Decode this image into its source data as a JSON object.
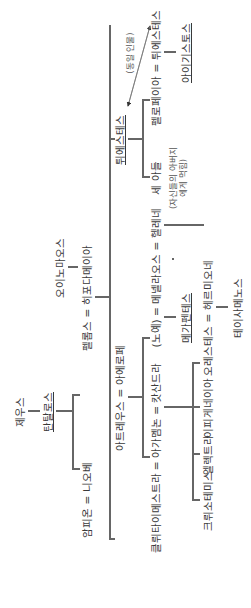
{
  "diagram": {
    "title": "",
    "orientation": "rotated-90-ccw",
    "nodes": {
      "zeus": "제우스",
      "tantalus": "탄탈로스",
      "oenomaus": "오이노마오스",
      "pelops_hippodamia": "펠롭스 = 히포다메이아",
      "amphion_niobe": "암피온 = 니오베",
      "atreus_aerope": "아트레우스 = 아에로페",
      "thyestes": "튀에스테스",
      "same_person_note": "(동일 인물)",
      "three_sons": "세 아들",
      "three_sons_note": "(자신들의 아버지에게 먹힘)",
      "pelopia_thyestes": "펠로페이아 = 튀에스테스",
      "aegisthus": "아이기스토스",
      "clytemnestra_agamemnon_cassandra": "클뤼타이메스트라 = 아가멤논 = 캇산드라",
      "slave_menelaus_helen": "(노예) = 메넬라오스 = 헬레네",
      "megapenthes": "메가펜테스",
      "chrysothemis": "크뤼소테미스",
      "electra": "엘렉트라",
      "iphigenia": "이피게네이아",
      "orestes_hermione": "오레스테스 = 헤르미오네",
      "tisamenus": "테이사메노스"
    },
    "relations": [
      {
        "parent": "제우스",
        "child": "탄탈로스"
      },
      {
        "parent": "탄탈로스",
        "children": [
          "펠롭스",
          "니오베"
        ]
      },
      {
        "parent": "오이노마오스",
        "child": "히포다메이아"
      },
      {
        "parent": "펠롭스 = 히포다메이아",
        "children": [
          "아트레우스",
          "튀에스테스"
        ]
      },
      {
        "parent": "아트레우스 = 아에로페",
        "children": [
          "아가멤논",
          "메넬라오스"
        ]
      },
      {
        "parent": "튀에스테스",
        "children": [
          "세 아들",
          "펠로페이아"
        ]
      },
      {
        "parent": "펠로페이아 = 튀에스테스",
        "child": "아이기스토스"
      },
      {
        "parent": "아가멤논 = 클뤼타이메스트라",
        "children": [
          "크뤼소테미스",
          "엘렉트라",
          "이피게네이아",
          "오레스테스"
        ]
      },
      {
        "parent": "(노예) = 메넬라오스",
        "child": "메가펜테스"
      },
      {
        "parent": "오레스테스 = 헤르미오네",
        "child": "테이사메노스"
      },
      {
        "parent": "메넬라오스 = 헬레네",
        "child": "헤르미오네"
      }
    ],
    "colors": {
      "line": "#666666",
      "text": "#3a3a3a",
      "background": "#ffffff"
    }
  }
}
